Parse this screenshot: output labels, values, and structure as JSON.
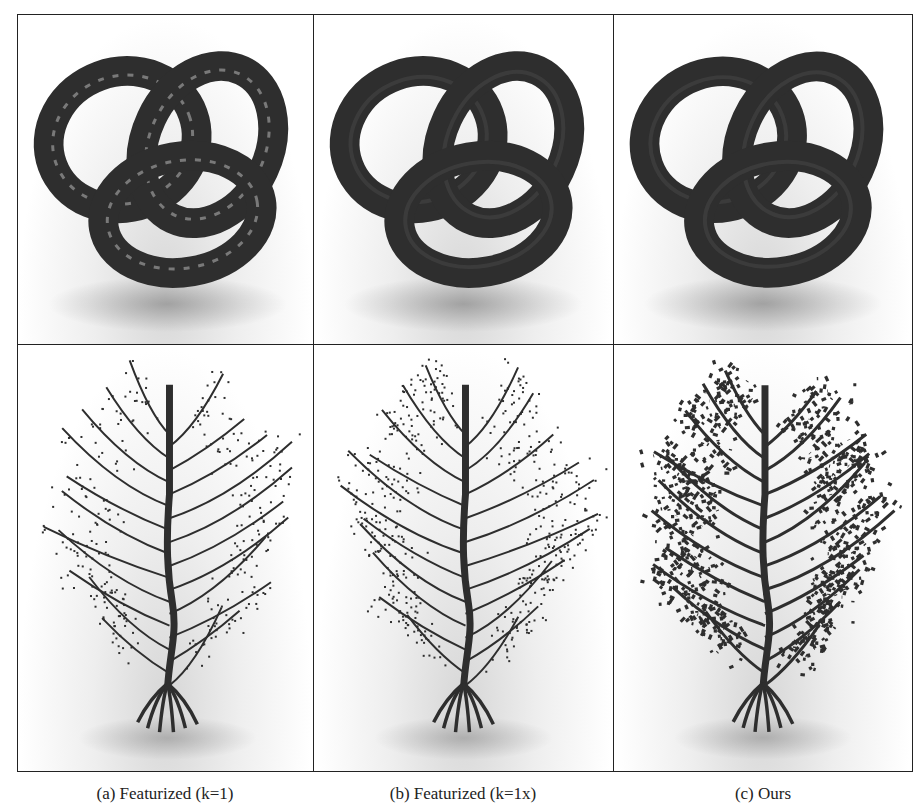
{
  "figure": {
    "rows": [
      {
        "subject": "trefoil-knot",
        "panels": [
          {
            "id": "a",
            "style": "glossy-noisy"
          },
          {
            "id": "b",
            "style": "matte"
          },
          {
            "id": "c",
            "style": "matte"
          }
        ]
      },
      {
        "subject": "tree",
        "panels": [
          {
            "id": "a",
            "style": "sparse-dotted-leaves"
          },
          {
            "id": "b",
            "style": "denser-dotted-leaves"
          },
          {
            "id": "c",
            "style": "dense-foliage"
          }
        ]
      }
    ],
    "captions": [
      "(a) Featurized (k=1)",
      "(b) Featurized (k=1x)",
      "(c) Ours"
    ],
    "colors": {
      "object": "#2e2e2e",
      "border": "#222222",
      "background": "#ffffff",
      "shadow": "#d0d0d0"
    }
  }
}
